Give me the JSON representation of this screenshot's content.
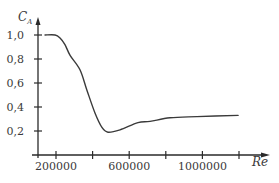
{
  "chart_data": {
    "type": "line",
    "title": "",
    "xlabel": "Re",
    "ylabel": "C_A",
    "ylabel_main": "C",
    "ylabel_sub": "A",
    "x_ticks": [
      200000,
      400000,
      600000,
      800000,
      1000000,
      1200000
    ],
    "x_tick_labels": [
      {
        "value": 200000,
        "label": "200000"
      },
      {
        "value": 600000,
        "label": "600000"
      },
      {
        "value": 1000000,
        "label": "1000000"
      }
    ],
    "y_ticks": [
      0.2,
      0.4,
      0.6,
      0.8,
      1.0
    ],
    "y_tick_labels": [
      "0,2",
      "0,4",
      "0,6",
      "0,8",
      "1,0"
    ],
    "xlim": [
      85000,
      1350000
    ],
    "ylim": [
      0,
      1.1
    ],
    "grid": false,
    "legend": null,
    "series": [
      {
        "name": "C_A",
        "x": [
          140000,
          195000,
          222000,
          249000,
          277000,
          331000,
          369000,
          413000,
          451000,
          484000,
          550000,
          648000,
          714000,
          823000,
          970000,
          1195000
        ],
        "y": [
          1.0,
          1.0,
          0.975,
          0.92,
          0.83,
          0.71,
          0.54,
          0.35,
          0.23,
          0.19,
          0.21,
          0.27,
          0.28,
          0.31,
          0.32,
          0.33
        ]
      }
    ]
  },
  "colors": {
    "line": "#3a3a3a",
    "axis": "#2a2a2a",
    "text": "#3a3a3a"
  }
}
